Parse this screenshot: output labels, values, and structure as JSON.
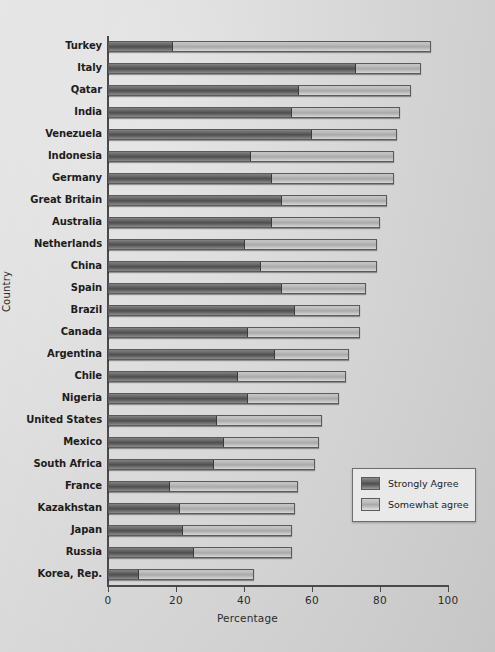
{
  "chart_data": {
    "type": "bar",
    "subtype": "horizontal-stacked",
    "title": "",
    "xlabel": "Percentage",
    "ylabel": "Country",
    "xlim": [
      0,
      100
    ],
    "xticks": [
      0,
      20,
      40,
      60,
      80,
      100
    ],
    "grid": false,
    "legend_position": "inside-lower-right",
    "categories": [
      "Turkey",
      "Italy",
      "Qatar",
      "India",
      "Venezuela",
      "Indonesia",
      "Germany",
      "Great Britain",
      "Australia",
      "Netherlands",
      "China",
      "Spain",
      "Brazil",
      "Canada",
      "Argentina",
      "Chile",
      "Nigeria",
      "United States",
      "Mexico",
      "South Africa",
      "France",
      "Kazakhstan",
      "Japan",
      "Russia",
      "Korea, Rep."
    ],
    "series": [
      {
        "name": "Strongly Agree",
        "color": "#5e5e5e",
        "values": [
          19,
          73,
          56,
          54,
          60,
          42,
          48,
          51,
          48,
          40,
          45,
          51,
          55,
          41,
          49,
          38,
          41,
          32,
          34,
          31,
          18,
          21,
          22,
          25,
          9
        ]
      },
      {
        "name": "Somewhat agree",
        "color": "#c0c0c0",
        "values": [
          76,
          19,
          33,
          32,
          25,
          42,
          36,
          31,
          32,
          39,
          34,
          25,
          19,
          33,
          22,
          32,
          27,
          31,
          28,
          30,
          38,
          34,
          32,
          29,
          34
        ]
      }
    ],
    "totals": [
      95,
      92,
      89,
      86,
      85,
      84,
      84,
      82,
      80,
      79,
      79,
      76,
      74,
      74,
      71,
      70,
      68,
      63,
      62,
      61,
      56,
      55,
      54,
      54,
      43
    ]
  },
  "legend": {
    "items": [
      {
        "label": "Strongly Agree"
      },
      {
        "label": "Somewhat agree"
      }
    ]
  },
  "axes": {
    "x_title": "Percentage",
    "y_title": "Country",
    "x_tick_labels": [
      "0",
      "20",
      "40",
      "60",
      "80",
      "100"
    ]
  }
}
